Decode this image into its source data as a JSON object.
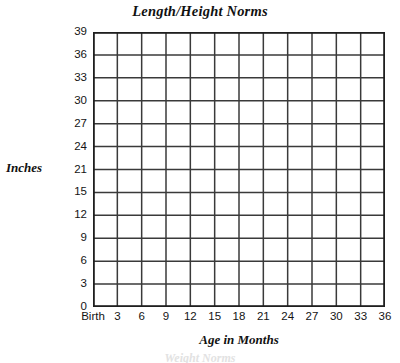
{
  "chart_data": {
    "type": "table",
    "title": "Length/Height Norms",
    "xlabel": "Age in Months",
    "ylabel": "Inches",
    "grid": true,
    "legend": null,
    "series": [],
    "values": [],
    "note_blank_grid": "Empty plotting grid — no data plotted",
    "x_axis": {
      "label": "Age in Months",
      "tick_labels": [
        "Birth",
        "3",
        "6",
        "9",
        "12",
        "15",
        "18",
        "21",
        "24",
        "27",
        "30",
        "33",
        "36"
      ],
      "tick_values": [
        0,
        3,
        6,
        9,
        12,
        15,
        18,
        21,
        24,
        27,
        30,
        33,
        36
      ],
      "range": [
        0,
        36
      ],
      "columns": 12
    },
    "y_axis": {
      "label": "Inches",
      "tick_labels": [
        "39",
        "36",
        "33",
        "30",
        "27",
        "24",
        "21",
        "15",
        "12",
        "9",
        "6",
        "3",
        "0"
      ],
      "tick_values": [
        39,
        36,
        33,
        30,
        27,
        24,
        21,
        15,
        12,
        9,
        6,
        3,
        0
      ],
      "range": [
        0,
        39
      ],
      "rows": 12
    },
    "colors": {
      "grid_line": "#3a3a3a",
      "axis_line": "#1f1f1f",
      "text": "#111111",
      "background": "#ffffff"
    }
  },
  "page": {
    "title": "Length/Height Norms",
    "cropped_top_text": "Length/Weight Norms",
    "cropped_bottom_text": "Weight Norms"
  }
}
